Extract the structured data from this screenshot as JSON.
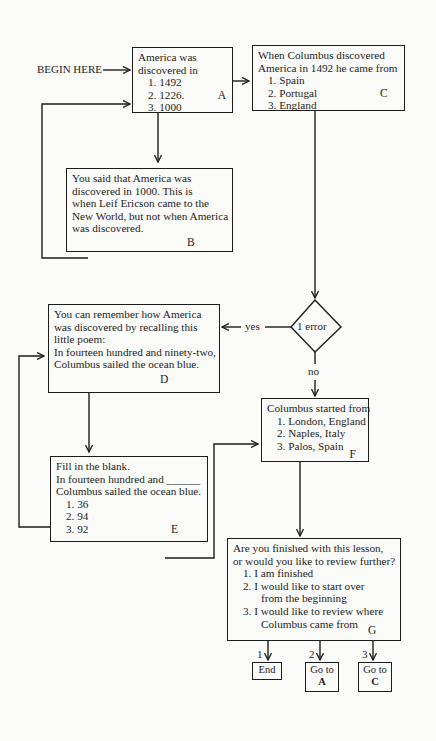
{
  "diagram": {
    "start_label": "BEGIN HERE",
    "frames": {
      "A": {
        "id": "A",
        "lines": [
          "America was",
          "discovered in"
        ],
        "options": [
          "1. 1492",
          "2. 1226.",
          "3. 1000"
        ]
      },
      "B": {
        "id": "B",
        "lines": [
          "You said that America was",
          "discovered in  1000. This is",
          "when Leif Ericson came to the",
          "New World, but not when America",
          "was discovered."
        ]
      },
      "C": {
        "id": "C",
        "lines": [
          "When Columbus discovered",
          "America in 1492 he came from"
        ],
        "options": [
          "1. Spain",
          "2. Portugal",
          "3. England"
        ]
      },
      "D": {
        "id": "D",
        "lines": [
          "You can remember how America",
          "was discovered by recalling this",
          "little poem:",
          "In fourteen hundred and ninety-two,",
          "Columbus sailed the ocean blue."
        ]
      },
      "E": {
        "id": "E",
        "lines": [
          "Fill in the blank.",
          "In fourteen hundred and ______",
          "Columbus sailed the ocean blue."
        ],
        "options": [
          "1. 36",
          "2. 94",
          "3. 92"
        ]
      },
      "F": {
        "id": "F",
        "lines": [
          "Columbus started from"
        ],
        "options": [
          "1. London, England",
          "2. Naples, Italy",
          "3. Palos, Spain"
        ]
      },
      "G": {
        "id": "G",
        "lines": [
          "Are you finished with this lesson,",
          "or would you like to review further?"
        ],
        "options": [
          "1. I am finished",
          "2. I would like to start over",
          "from the beginning",
          "3. I would like to review where",
          "Columbus came from"
        ]
      }
    },
    "decision": {
      "text": "1 error",
      "yes_label": "yes",
      "no_label": "no"
    },
    "exits": [
      {
        "number": "1",
        "text_line1": "End",
        "text_line2": ""
      },
      {
        "number": "2",
        "text_line1": "Go to",
        "text_line2": "A"
      },
      {
        "number": "3",
        "text_line1": "Go to",
        "text_line2": "C"
      }
    ]
  }
}
